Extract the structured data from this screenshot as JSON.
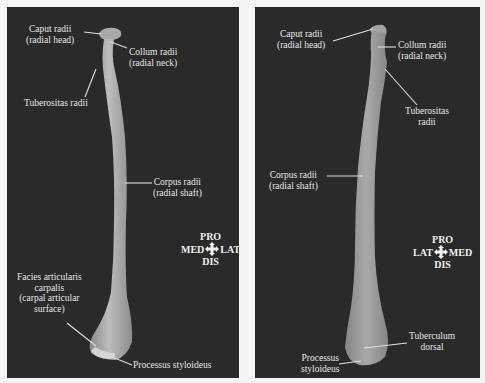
{
  "panels": [
    {
      "id": "left",
      "labels": {
        "caput": {
          "line1": "Caput radii",
          "line2": "(radial head)"
        },
        "collum": {
          "line1": "Collum radii",
          "line2": "(radial neck)"
        },
        "tuberositas": {
          "line1": "Tuberositas radii"
        },
        "corpus": {
          "line1": "Corpus radii",
          "line2": "(radial shaft)"
        },
        "facies": {
          "line1": "Facies articularis",
          "line2": "carpalis",
          "line3": "(carpal articular",
          "line4": "surface)"
        },
        "processus": {
          "line1": "Processus styloideus"
        }
      },
      "compass": {
        "top": "PRO",
        "left": "MED",
        "right": "LAT",
        "bottom": "DIS"
      }
    },
    {
      "id": "right",
      "labels": {
        "caput": {
          "line1": "Caput radii",
          "line2": "(radial head)"
        },
        "collum": {
          "line1": "Collum radii",
          "line2": "(radial neck)"
        },
        "tuberositas": {
          "line1": "Tuberositas",
          "line2": "radii"
        },
        "corpus": {
          "line1": "Corpus radii",
          "line2": "(radial shaft)"
        },
        "tuberculum": {
          "line1": "Tuberculum",
          "line2": "dorsal"
        },
        "processus": {
          "line1": "Processus",
          "line2": "styloideus"
        }
      },
      "compass": {
        "top": "PRO",
        "left": "LAT",
        "right": "MED",
        "bottom": "DIS"
      }
    }
  ],
  "colors": {
    "background": "#f4f4f4",
    "panel": "#2a2a2a",
    "bone": "#9c9c9c",
    "bone_highlight": "#b8b8b8",
    "label": "#e6e6e6",
    "leader_line": "#e0e0e0"
  }
}
